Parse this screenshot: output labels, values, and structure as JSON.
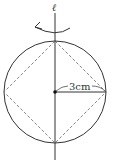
{
  "diagram": {
    "axis_label": "ℓ",
    "radius_label": "3cm",
    "colors": {
      "stroke": "#333333",
      "dashed": "#777777",
      "background": "#ffffff"
    },
    "shapes": {
      "circle": {
        "cx": 55,
        "cy": 92,
        "r": 51
      },
      "axis": {
        "x": 55,
        "y1": 8,
        "y2": 160
      },
      "inscribed_square": "dashed, vertices at circle top/right/bottom/left",
      "radius_segment": {
        "from": [
          55,
          92
        ],
        "to": [
          106,
          92
        ]
      },
      "rotation_arrow": "curved arrow around axis, pointing left"
    }
  }
}
